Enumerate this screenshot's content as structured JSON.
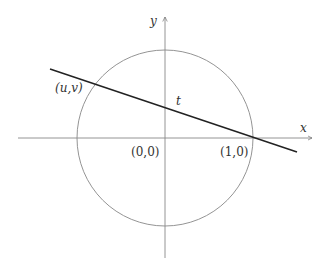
{
  "diagram": {
    "axes": {
      "x_label": "x",
      "y_label": "y"
    },
    "points": {
      "origin": "(0,0)",
      "unit": "(1,0)",
      "intersection": "(u,v)"
    },
    "line_label": "t",
    "colors": {
      "circle": "#777777",
      "axes": "#777777",
      "line": "#222222"
    }
  }
}
